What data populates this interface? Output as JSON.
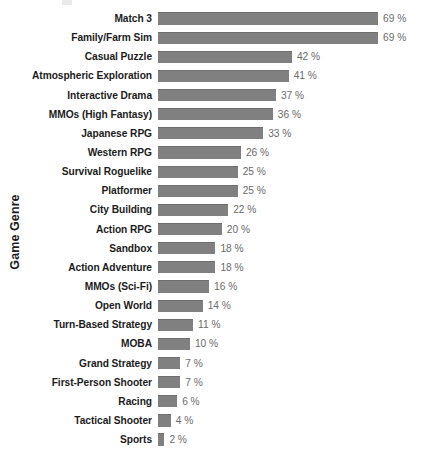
{
  "chart_data": {
    "type": "bar",
    "orientation": "horizontal",
    "title": "",
    "xlabel": "",
    "ylabel": "Game Genre",
    "grid": false,
    "legend": null,
    "value_suffix": "%",
    "xlim": [
      0,
      69
    ],
    "bar_color": "#808080",
    "categories": [
      "Match 3",
      "Family/Farm Sim",
      "Casual Puzzle",
      "Atmospheric Exploration",
      "Interactive Drama",
      "MMOs (High Fantasy)",
      "Japanese RPG",
      "Western RPG",
      "Survival Roguelike",
      "Platformer",
      "City Building",
      "Action RPG",
      "Sandbox",
      "Action Adventure",
      "MMOs (Sci-Fi)",
      "Open World",
      "Turn-Based Strategy",
      "MOBA",
      "Grand Strategy",
      "First-Person Shooter",
      "Racing",
      "Tactical Shooter",
      "Sports"
    ],
    "values": [
      69,
      69,
      42,
      41,
      37,
      36,
      33,
      26,
      25,
      25,
      22,
      20,
      18,
      18,
      16,
      14,
      11,
      10,
      7,
      7,
      6,
      4,
      2
    ],
    "value_labels": [
      "69 %",
      "69 %",
      "42 %",
      "41 %",
      "37 %",
      "36 %",
      "33 %",
      "26 %",
      "25 %",
      "25 %",
      "22 %",
      "20 %",
      "18 %",
      "18 %",
      "16 %",
      "14 %",
      "11 %",
      "10 %",
      "7 %",
      "7 %",
      "6 %",
      "4 %",
      "2 %"
    ]
  },
  "axis": {
    "y_title": "Game Genre"
  }
}
